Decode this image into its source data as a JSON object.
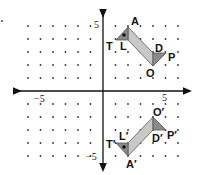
{
  "diagram": {
    "title": "",
    "grid": {
      "xmin": -6,
      "xmax": 6,
      "ymin": -5,
      "ymax": 5,
      "dot_color": "#333333"
    },
    "axis_labels": {
      "x_pos": "5",
      "x_neg": "−5",
      "y_pos": "5",
      "y_neg": "−5"
    },
    "colors": {
      "band": "#c8c8c8",
      "triangle": "#8a8a8a",
      "stroke": "#555555"
    },
    "original_figure": {
      "points": {
        "T": [
          1,
          4
        ],
        "A": [
          2,
          5
        ],
        "L": [
          2,
          4
        ],
        "D": [
          4,
          3
        ],
        "P": [
          5,
          3
        ],
        "O": [
          4,
          2
        ]
      },
      "labels": {
        "T": "T",
        "A": "A",
        "L": "L",
        "D": "D",
        "P": "P",
        "O": "O"
      }
    },
    "image_figure": {
      "transformation": "reflection over x-axis",
      "points": {
        "T'": [
          1,
          -4
        ],
        "A'": [
          2,
          -5
        ],
        "L'": [
          2,
          -4
        ],
        "D'": [
          4,
          -3
        ],
        "P'": [
          5,
          -3
        ],
        "O'": [
          4,
          -2
        ]
      },
      "labels": {
        "T": "T′",
        "A": "A′",
        "L": "L′",
        "D": "D′",
        "P": "P′",
        "O": "O′"
      }
    }
  }
}
